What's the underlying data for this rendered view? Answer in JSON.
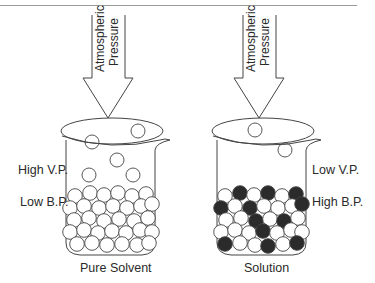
{
  "colors": {
    "stroke": "#444444",
    "rule": "#9a9a9a",
    "solvent_fill": "#ffffff",
    "solute_fill": "#2b2b2b",
    "text": "#2a2a2a"
  },
  "left_beaker": {
    "caption": "Pure Solvent",
    "label_top": "High V.P.",
    "label_bottom": "Low B.P.",
    "arrow": {
      "line1": "Atmospheric",
      "line2": "Pressure"
    },
    "vapor_particles": [
      [
        92,
        142
      ],
      [
        138,
        131
      ],
      [
        117,
        160
      ],
      [
        89,
        175
      ],
      [
        133,
        175
      ]
    ],
    "liquid_particles": [
      [
        75,
        196,
        "s"
      ],
      [
        90,
        193,
        "s"
      ],
      [
        104,
        195,
        "s"
      ],
      [
        118,
        193,
        "s"
      ],
      [
        132,
        196,
        "s"
      ],
      [
        146,
        194,
        "s"
      ],
      [
        70,
        208,
        "s"
      ],
      [
        84,
        206,
        "s"
      ],
      [
        99,
        208,
        "s"
      ],
      [
        113,
        206,
        "s"
      ],
      [
        127,
        208,
        "s"
      ],
      [
        141,
        206,
        "s"
      ],
      [
        152,
        204,
        "s"
      ],
      [
        74,
        220,
        "s"
      ],
      [
        89,
        218,
        "s"
      ],
      [
        104,
        221,
        "s"
      ],
      [
        119,
        219,
        "s"
      ],
      [
        134,
        221,
        "s"
      ],
      [
        148,
        218,
        "s"
      ],
      [
        70,
        232,
        "s"
      ],
      [
        84,
        230,
        "s"
      ],
      [
        98,
        233,
        "s"
      ],
      [
        112,
        231,
        "s"
      ],
      [
        126,
        233,
        "s"
      ],
      [
        140,
        230,
        "s"
      ],
      [
        152,
        232,
        "s"
      ],
      [
        77,
        244,
        "s"
      ],
      [
        92,
        243,
        "s"
      ],
      [
        107,
        245,
        "s"
      ],
      [
        122,
        244,
        "s"
      ],
      [
        137,
        245,
        "s"
      ],
      [
        149,
        243,
        "s"
      ]
    ]
  },
  "right_beaker": {
    "caption": "Solution",
    "label_top": "Low V.P.",
    "label_bottom": "High B.P.",
    "arrow": {
      "line1": "Atmospheric",
      "line2": "Pressure"
    },
    "vapor_particles": [
      [
        255,
        130
      ],
      [
        285,
        150
      ]
    ],
    "liquid_particles": [
      [
        225,
        196,
        "s"
      ],
      [
        240,
        193,
        "d"
      ],
      [
        254,
        195,
        "s"
      ],
      [
        268,
        193,
        "d"
      ],
      [
        282,
        196,
        "s"
      ],
      [
        296,
        194,
        "d"
      ],
      [
        221,
        208,
        "d"
      ],
      [
        235,
        206,
        "s"
      ],
      [
        250,
        208,
        "d"
      ],
      [
        264,
        206,
        "s"
      ],
      [
        278,
        208,
        "s"
      ],
      [
        292,
        206,
        "s"
      ],
      [
        302,
        204,
        "d"
      ],
      [
        226,
        220,
        "s"
      ],
      [
        241,
        218,
        "s"
      ],
      [
        256,
        221,
        "d"
      ],
      [
        270,
        219,
        "s"
      ],
      [
        284,
        221,
        "d"
      ],
      [
        298,
        218,
        "s"
      ],
      [
        221,
        232,
        "s"
      ],
      [
        235,
        230,
        "s"
      ],
      [
        249,
        233,
        "s"
      ],
      [
        263,
        231,
        "d"
      ],
      [
        277,
        233,
        "s"
      ],
      [
        291,
        230,
        "s"
      ],
      [
        302,
        232,
        "s"
      ],
      [
        225,
        244,
        "d"
      ],
      [
        240,
        243,
        "s"
      ],
      [
        255,
        245,
        "s"
      ],
      [
        268,
        246,
        "d"
      ],
      [
        283,
        244,
        "s"
      ],
      [
        297,
        243,
        "d"
      ]
    ]
  }
}
